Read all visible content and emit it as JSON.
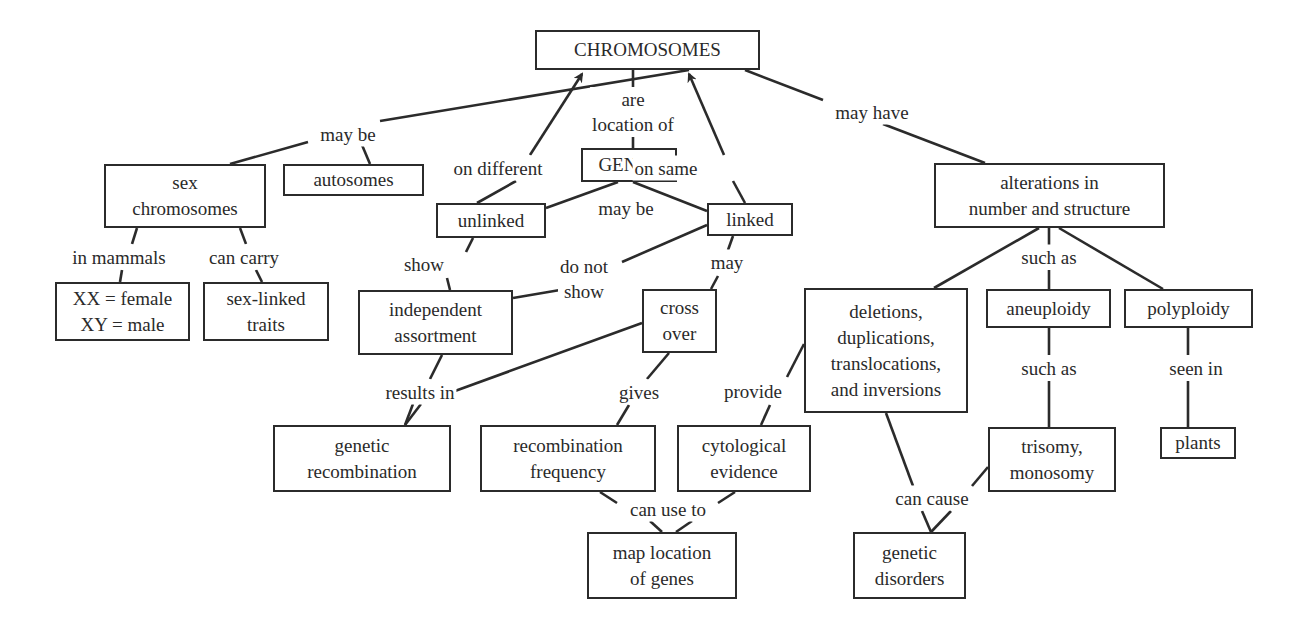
{
  "diagram": {
    "type": "concept-map",
    "line_color": "#2b2b2b",
    "nodes": [
      {
        "id": "chromosomes",
        "text": "CHROMOSOMES",
        "box": [
          535,
          30,
          225,
          40
        ]
      },
      {
        "id": "genes",
        "text": "GENES",
        "box": [
          581,
          148,
          96,
          34
        ]
      },
      {
        "id": "sex-chromosomes",
        "text": "sex\nchromosomes",
        "box": [
          104,
          164,
          162,
          64
        ]
      },
      {
        "id": "autosomes",
        "text": "autosomes",
        "box": [
          283,
          164,
          141,
          32
        ]
      },
      {
        "id": "unlinked",
        "text": "unlinked",
        "box": [
          436,
          203,
          110,
          35
        ]
      },
      {
        "id": "linked",
        "text": "linked",
        "box": [
          707,
          203,
          86,
          33
        ]
      },
      {
        "id": "xx-xy",
        "text": "XX = female\nXY = male",
        "box": [
          55,
          282,
          135,
          59
        ]
      },
      {
        "id": "sex-linked-traits",
        "text": "sex-linked\ntraits",
        "box": [
          203,
          282,
          126,
          59
        ]
      },
      {
        "id": "independent-assortment",
        "text": "independent\nassortment",
        "box": [
          358,
          290,
          155,
          65
        ]
      },
      {
        "id": "cross-over",
        "text": "cross\nover",
        "box": [
          642,
          289,
          75,
          64
        ]
      },
      {
        "id": "alterations",
        "text": "alterations in\nnumber and structure",
        "box": [
          934,
          163,
          231,
          65
        ]
      },
      {
        "id": "deletions",
        "text": "deletions,\nduplications,\ntranslocations,\nand inversions",
        "box": [
          804,
          288,
          164,
          125
        ]
      },
      {
        "id": "aneuploidy",
        "text": "aneuploidy",
        "box": [
          986,
          289,
          125,
          39
        ]
      },
      {
        "id": "polyploidy",
        "text": "polyploidy",
        "box": [
          1124,
          289,
          129,
          39
        ]
      },
      {
        "id": "genetic-recombination",
        "text": "genetic\nrecombination",
        "box": [
          273,
          425,
          178,
          67
        ]
      },
      {
        "id": "recombination-frequency",
        "text": "recombination\nfrequency",
        "box": [
          480,
          425,
          176,
          67
        ]
      },
      {
        "id": "cytological-evidence",
        "text": "cytological\nevidence",
        "box": [
          677,
          425,
          134,
          67
        ]
      },
      {
        "id": "trisomy-monosomy",
        "text": "trisomy,\nmonosomy",
        "box": [
          988,
          427,
          128,
          65
        ]
      },
      {
        "id": "plants",
        "text": "plants",
        "box": [
          1160,
          427,
          76,
          32
        ]
      },
      {
        "id": "map-location",
        "text": "map location\nof genes",
        "box": [
          587,
          532,
          150,
          67
        ]
      },
      {
        "id": "genetic-disorders",
        "text": "genetic\ndisorders",
        "box": [
          853,
          532,
          113,
          67
        ]
      }
    ],
    "labels": [
      {
        "id": "may-be-1",
        "text": "may be",
        "pos": [
          348,
          134
        ]
      },
      {
        "id": "are-location-of",
        "text": "are\nlocation of",
        "pos": [
          633,
          112
        ]
      },
      {
        "id": "on-different",
        "text": "on different",
        "pos": [
          498,
          168
        ]
      },
      {
        "id": "on-same",
        "text": "on same",
        "pos": [
          666,
          168
        ]
      },
      {
        "id": "may-have",
        "text": "may have",
        "pos": [
          872,
          112
        ]
      },
      {
        "id": "may-be-2",
        "text": "may be",
        "pos": [
          626,
          208
        ]
      },
      {
        "id": "in-mammals",
        "text": "in mammals",
        "pos": [
          119,
          257
        ]
      },
      {
        "id": "can-carry",
        "text": "can carry",
        "pos": [
          244,
          257
        ]
      },
      {
        "id": "show",
        "text": "show",
        "pos": [
          424,
          264
        ]
      },
      {
        "id": "do-not-show",
        "text": "do not\nshow",
        "pos": [
          584,
          279
        ]
      },
      {
        "id": "may",
        "text": "may",
        "pos": [
          727,
          262
        ]
      },
      {
        "id": "such-as-1",
        "text": "such as",
        "pos": [
          1049,
          257
        ]
      },
      {
        "id": "results-in",
        "text": "results in",
        "pos": [
          420,
          392
        ]
      },
      {
        "id": "gives",
        "text": "gives",
        "pos": [
          639,
          392
        ]
      },
      {
        "id": "provide",
        "text": "provide",
        "pos": [
          753,
          391
        ]
      },
      {
        "id": "such-as-2",
        "text": "such as",
        "pos": [
          1049,
          368
        ]
      },
      {
        "id": "seen-in",
        "text": "seen in",
        "pos": [
          1196,
          368
        ]
      },
      {
        "id": "can-use-to",
        "text": "can use to",
        "pos": [
          668,
          509
        ]
      },
      {
        "id": "can-cause",
        "text": "can cause",
        "pos": [
          932,
          498
        ]
      }
    ],
    "edges": [
      {
        "from": [
          689,
          70
        ],
        "to": [
          380,
          121
        ],
        "arrow": false
      },
      {
        "from": [
          308,
          142
        ],
        "to": [
          230,
          164
        ],
        "arrow": false
      },
      {
        "from": [
          362,
          145
        ],
        "to": [
          370,
          164
        ],
        "arrow": false
      },
      {
        "from": [
          633,
          70
        ],
        "to": [
          633,
          90
        ],
        "arrow": false
      },
      {
        "from": [
          633,
          134
        ],
        "to": [
          633,
          148
        ],
        "arrow": false
      },
      {
        "from": [
          530,
          155
        ],
        "to": [
          582,
          74
        ],
        "arrow": true
      },
      {
        "from": [
          477,
          203
        ],
        "to": [
          516,
          181
        ],
        "arrow": false
      },
      {
        "from": [
          724,
          155
        ],
        "to": [
          689,
          74
        ],
        "arrow": true
      },
      {
        "from": [
          745,
          203
        ],
        "to": [
          733,
          181
        ],
        "arrow": false
      },
      {
        "from": [
          745,
          70
        ],
        "to": [
          823,
          100
        ],
        "arrow": false
      },
      {
        "from": [
          883,
          124
        ],
        "to": [
          985,
          163
        ],
        "arrow": false
      },
      {
        "from": [
          618,
          182
        ],
        "to": [
          546,
          208
        ],
        "arrow": false
      },
      {
        "from": [
          633,
          182
        ],
        "to": [
          707,
          211
        ],
        "arrow": false
      },
      {
        "from": [
          137,
          228
        ],
        "to": [
          132,
          244
        ],
        "arrow": false
      },
      {
        "from": [
          240,
          228
        ],
        "to": [
          246,
          244
        ],
        "arrow": false
      },
      {
        "from": [
          122,
          270
        ],
        "to": [
          120,
          282
        ],
        "arrow": false
      },
      {
        "from": [
          256,
          270
        ],
        "to": [
          262,
          282
        ],
        "arrow": false
      },
      {
        "from": [
          473,
          238
        ],
        "to": [
          466,
          252
        ],
        "arrow": false
      },
      {
        "from": [
          447,
          278
        ],
        "to": [
          450,
          290
        ],
        "arrow": false
      },
      {
        "from": [
          707,
          225
        ],
        "to": [
          622,
          262
        ],
        "arrow": false
      },
      {
        "from": [
          560,
          290
        ],
        "to": [
          513,
          298
        ],
        "arrow": false
      },
      {
        "from": [
          733,
          236
        ],
        "to": [
          728,
          250
        ],
        "arrow": false
      },
      {
        "from": [
          718,
          276
        ],
        "to": [
          711,
          289
        ],
        "arrow": false
      },
      {
        "from": [
          442,
          355
        ],
        "to": [
          430,
          379
        ],
        "arrow": false
      },
      {
        "from": [
          642,
          323
        ],
        "to": [
          455,
          391
        ],
        "arrow": false
      },
      {
        "from": [
          413,
          404
        ],
        "to": [
          405,
          425
        ],
        "arrow": false
      },
      {
        "from": [
          421,
          404
        ],
        "to": [
          405,
          425
        ],
        "arrow": false
      },
      {
        "from": [
          669,
          353
        ],
        "to": [
          647,
          379
        ],
        "arrow": false
      },
      {
        "from": [
          629,
          405
        ],
        "to": [
          617,
          425
        ],
        "arrow": false
      },
      {
        "from": [
          804,
          344
        ],
        "to": [
          787,
          377
        ],
        "arrow": false
      },
      {
        "from": [
          770,
          405
        ],
        "to": [
          761,
          425
        ],
        "arrow": false
      },
      {
        "from": [
          1039,
          228
        ],
        "to": [
          934,
          288
        ],
        "arrow": false
      },
      {
        "from": [
          1049,
          228
        ],
        "to": [
          1049,
          245
        ],
        "arrow": false
      },
      {
        "from": [
          1049,
          270
        ],
        "to": [
          1049,
          289
        ],
        "arrow": false
      },
      {
        "from": [
          1059,
          228
        ],
        "to": [
          1163,
          289
        ],
        "arrow": false
      },
      {
        "from": [
          1049,
          328
        ],
        "to": [
          1049,
          355
        ],
        "arrow": false
      },
      {
        "from": [
          1049,
          381
        ],
        "to": [
          1049,
          427
        ],
        "arrow": false
      },
      {
        "from": [
          1188,
          328
        ],
        "to": [
          1188,
          355
        ],
        "arrow": false
      },
      {
        "from": [
          1188,
          381
        ],
        "to": [
          1188,
          427
        ],
        "arrow": false
      },
      {
        "from": [
          886,
          413
        ],
        "to": [
          913,
          486
        ],
        "arrow": false
      },
      {
        "from": [
          988,
          467
        ],
        "to": [
          972,
          486
        ],
        "arrow": false
      },
      {
        "from": [
          922,
          511
        ],
        "to": [
          931,
          532
        ],
        "arrow": false
      },
      {
        "from": [
          951,
          511
        ],
        "to": [
          931,
          532
        ],
        "arrow": false
      },
      {
        "from": [
          600,
          492
        ],
        "to": [
          617,
          503
        ],
        "arrow": false
      },
      {
        "from": [
          735,
          492
        ],
        "to": [
          718,
          503
        ],
        "arrow": false
      },
      {
        "from": [
          650,
          521
        ],
        "to": [
          662,
          532
        ],
        "arrow": false
      },
      {
        "from": [
          692,
          521
        ],
        "to": [
          676,
          532
        ],
        "arrow": false
      }
    ]
  }
}
